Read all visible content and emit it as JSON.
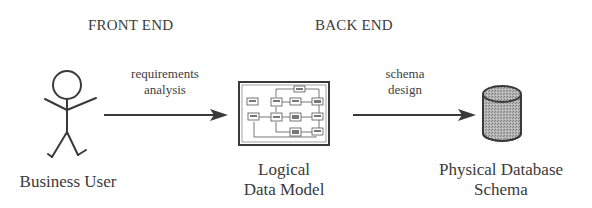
{
  "diagram": {
    "headers": {
      "front_end": "FRONT END",
      "back_end": "BACK END"
    },
    "arrows": [
      {
        "from": "Business User",
        "to": "Logical Data Model",
        "label_line1": "requirements",
        "label_line2": "analysis"
      },
      {
        "from": "Logical Data Model",
        "to": "Physical Database Schema",
        "label_line1": "schema",
        "label_line2": "design"
      }
    ],
    "nodes": [
      {
        "id": "business-user",
        "icon": "stick-figure-icon",
        "label_line1": "Business User"
      },
      {
        "id": "logical-data-model",
        "icon": "data-model-diagram-icon",
        "label_line1": "Logical",
        "label_line2": "Data Model"
      },
      {
        "id": "physical-database-schema",
        "icon": "database-cylinder-icon",
        "label_line1": "Physical Database",
        "label_line2": "Schema"
      }
    ],
    "colors": {
      "ink": "#3a3a3a",
      "cylinder_fill": "#a8a8a8",
      "background": "#ffffff"
    }
  }
}
